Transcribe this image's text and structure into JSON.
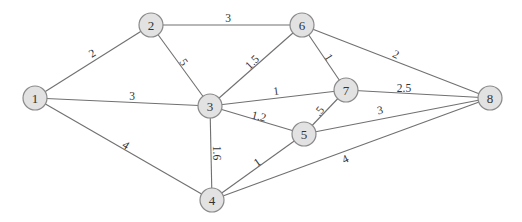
{
  "graph": {
    "type": "weighted-undirected-graph",
    "colors": {
      "node_fill": "#e2e2e2",
      "node_stroke": "#8a8a8a",
      "edge": "#707070",
      "text": "#333333"
    },
    "nodes": [
      {
        "id": "1",
        "label": "1",
        "x": 35,
        "y": 98
      },
      {
        "id": "2",
        "label": "2",
        "x": 151,
        "y": 25
      },
      {
        "id": "3",
        "label": "3",
        "x": 210,
        "y": 106
      },
      {
        "id": "4",
        "label": "4",
        "x": 212,
        "y": 200
      },
      {
        "id": "5",
        "label": "5",
        "x": 304,
        "y": 134
      },
      {
        "id": "6",
        "label": "6",
        "x": 302,
        "y": 25
      },
      {
        "id": "7",
        "label": "7",
        "x": 346,
        "y": 90
      },
      {
        "id": "8",
        "label": "8",
        "x": 490,
        "y": 98
      }
    ],
    "edges": [
      {
        "from": "1",
        "to": "2",
        "weight": "2",
        "lx": 92,
        "ly": 53,
        "rot": -32
      },
      {
        "from": "1",
        "to": "3",
        "weight": "3",
        "lx": 132,
        "ly": 96,
        "rot": 0
      },
      {
        "from": "1",
        "to": "4",
        "weight": "4",
        "lx": 126,
        "ly": 145,
        "rot": 32
      },
      {
        "from": "2",
        "to": "6",
        "weight": "3",
        "lx": 228,
        "ly": 18,
        "rot": 0
      },
      {
        "from": "2",
        "to": "3",
        "weight": "5",
        "lx": 184,
        "ly": 62,
        "rot": 55
      },
      {
        "from": "3",
        "to": "6",
        "weight": "1.5",
        "lx": 252,
        "ly": 62,
        "rot": -45
      },
      {
        "from": "3",
        "to": "7",
        "weight": "1",
        "lx": 276,
        "ly": 91,
        "rot": -8
      },
      {
        "from": "3",
        "to": "5",
        "weight": "1.2",
        "lx": 259,
        "ly": 116,
        "rot": 14
      },
      {
        "from": "3",
        "to": "4",
        "weight": "1.6",
        "lx": 217,
        "ly": 153,
        "rot": 90
      },
      {
        "from": "6",
        "to": "7",
        "weight": "1",
        "lx": 329,
        "ly": 57,
        "rot": 58
      },
      {
        "from": "6",
        "to": "8",
        "weight": "2",
        "lx": 396,
        "ly": 54,
        "rot": 25
      },
      {
        "from": "7",
        "to": "8",
        "weight": "2.5",
        "lx": 404,
        "ly": 88,
        "rot": 0
      },
      {
        "from": "7",
        "to": "5",
        "weight": ".5",
        "lx": 319,
        "ly": 111,
        "rot": -52
      },
      {
        "from": "5",
        "to": "8",
        "weight": "3",
        "lx": 380,
        "ly": 110,
        "rot": -12
      },
      {
        "from": "4",
        "to": "5",
        "weight": "1",
        "lx": 257,
        "ly": 162,
        "rot": -35
      },
      {
        "from": "4",
        "to": "8",
        "weight": "4",
        "lx": 345,
        "ly": 159,
        "rot": -26
      }
    ]
  }
}
